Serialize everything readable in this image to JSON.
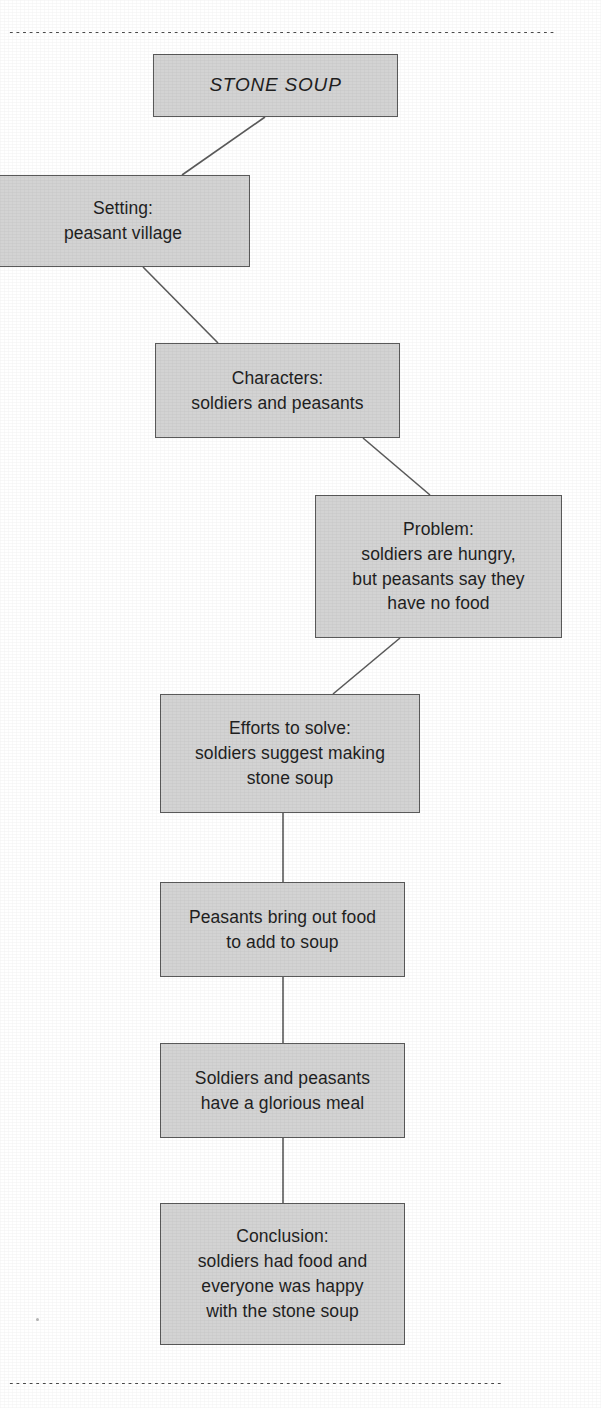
{
  "page": {
    "top_fragment": "",
    "grain_note": ""
  },
  "rules": {
    "top_label": "dotted-divider-top",
    "bottom_label": "dotted-divider-bottom"
  },
  "chart_data": {
    "type": "diagram",
    "subtype": "story-map-flow-chart",
    "title": "STONE SOUP",
    "orientation": "vertical zig-zag",
    "node_fill": "#d3d3d3",
    "node_border": "#5a5a5a",
    "connector_color": "#5a5a5a",
    "nodes": [
      {
        "id": "title",
        "label": "STONE SOUP",
        "lines": [
          "STONE SOUP"
        ],
        "style": "italic",
        "x": 153,
        "y": 54,
        "w": 245,
        "h": 63
      },
      {
        "id": "setting",
        "label": "Setting: peasant village",
        "lines": [
          "Setting:",
          "peasant village"
        ],
        "x": -4,
        "y": 175,
        "w": 254,
        "h": 92
      },
      {
        "id": "characters",
        "label": "Characters: soldiers and peasants",
        "lines": [
          "Characters:",
          "soldiers and peasants"
        ],
        "x": 155,
        "y": 343,
        "w": 245,
        "h": 95
      },
      {
        "id": "problem",
        "label": "Problem: soldiers are hungry, but peasants say they have no food",
        "lines": [
          "Problem:",
          "soldiers are hungry,",
          "but peasants say they",
          "have no food"
        ],
        "x": 315,
        "y": 495,
        "w": 247,
        "h": 143
      },
      {
        "id": "efforts",
        "label": "Efforts to solve: soldiers suggest making stone soup",
        "lines": [
          "Efforts to solve:",
          "soldiers suggest making",
          "stone soup"
        ],
        "x": 160,
        "y": 694,
        "w": 260,
        "h": 119
      },
      {
        "id": "peasants-food",
        "label": "Peasants bring out food to add to soup",
        "lines": [
          "Peasants bring out food",
          "to add to soup"
        ],
        "x": 160,
        "y": 882,
        "w": 245,
        "h": 95
      },
      {
        "id": "glorious-meal",
        "label": "Soldiers and peasants have a glorious meal",
        "lines": [
          "Soldiers and peasants",
          "have a glorious meal"
        ],
        "x": 160,
        "y": 1043,
        "w": 245,
        "h": 95
      },
      {
        "id": "conclusion",
        "label": "Conclusion: soldiers had food and everyone was happy with the stone soup",
        "lines": [
          "Conclusion:",
          "soldiers had food and",
          "everyone was happy",
          "with the stone soup"
        ],
        "x": 160,
        "y": 1203,
        "w": 245,
        "h": 142
      }
    ],
    "edges": [
      {
        "from": "title",
        "to": "setting",
        "kind": "diagonal",
        "x1": 265,
        "y1": 117,
        "x2": 182,
        "y2": 175
      },
      {
        "from": "setting",
        "to": "characters",
        "kind": "diagonal",
        "x1": 143,
        "y1": 267,
        "x2": 218,
        "y2": 343
      },
      {
        "from": "characters",
        "to": "problem",
        "kind": "diagonal",
        "x1": 363,
        "y1": 438,
        "x2": 430,
        "y2": 495
      },
      {
        "from": "problem",
        "to": "efforts",
        "kind": "diagonal",
        "x1": 400,
        "y1": 638,
        "x2": 333,
        "y2": 694
      },
      {
        "from": "efforts",
        "to": "peasants-food",
        "kind": "vertical",
        "x1": 283,
        "y1": 813,
        "x2": 283,
        "y2": 882
      },
      {
        "from": "peasants-food",
        "to": "glorious-meal",
        "kind": "vertical",
        "x1": 283,
        "y1": 977,
        "x2": 283,
        "y2": 1043
      },
      {
        "from": "glorious-meal",
        "to": "conclusion",
        "kind": "vertical",
        "x1": 283,
        "y1": 1138,
        "x2": 283,
        "y2": 1203
      }
    ]
  }
}
